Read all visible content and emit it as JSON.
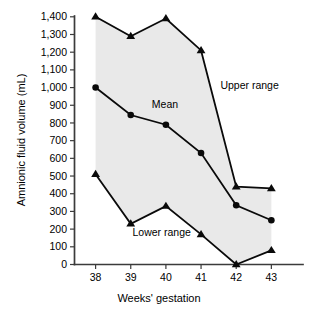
{
  "chart_data": {
    "type": "line",
    "title": "",
    "xlabel": "Weeks' gestation",
    "ylabel": "Amnionic fluid volume (mL)",
    "categories": [
      "38",
      "39",
      "40",
      "41",
      "42",
      "43"
    ],
    "x": [
      38,
      39,
      40,
      41,
      42,
      43
    ],
    "xlim": [
      37.4,
      43.9
    ],
    "ylim": [
      0,
      1400
    ],
    "ytick_values": [
      0,
      100,
      200,
      300,
      400,
      500,
      600,
      700,
      800,
      900,
      1000,
      1100,
      1200,
      1300,
      1400
    ],
    "ytick_labels": [
      "0",
      "100",
      "200",
      "300",
      "400",
      "500",
      "600",
      "700",
      "800",
      "900",
      "1,000",
      "1,100",
      "1,200",
      "1,300",
      "1,400"
    ],
    "xtick_labels": [
      "38",
      "39",
      "40",
      "41",
      "42",
      "43"
    ],
    "grid": false,
    "legend_position": "inline-annotations",
    "band_fill": "#e9e9e9",
    "line_color": "#0a0a0a",
    "series": [
      {
        "name": "Upper range",
        "marker": "triangle",
        "values": [
          1400,
          1290,
          1390,
          1210,
          440,
          430
        ]
      },
      {
        "name": "Mean",
        "marker": "circle",
        "values": [
          1000,
          845,
          790,
          630,
          335,
          250
        ]
      },
      {
        "name": "Lower range",
        "marker": "triangle",
        "values": [
          510,
          230,
          330,
          170,
          0,
          80
        ]
      }
    ],
    "annotations": [
      {
        "text": "Upper range",
        "x": 41.55,
        "y": 990
      },
      {
        "text": "Mean",
        "x": 39.6,
        "y": 885
      },
      {
        "text": "Lower range",
        "x": 39.05,
        "y": 160
      }
    ]
  }
}
